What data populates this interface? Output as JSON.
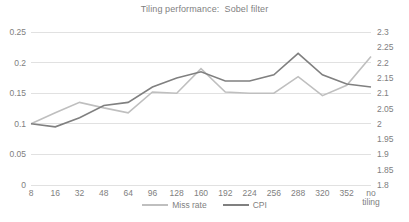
{
  "chart_data": {
    "type": "line",
    "title": "Tiling performance:  Sobel filter",
    "xlabel": "",
    "ylabel": "",
    "grid": true,
    "legend_position": "bottom",
    "categories": [
      "8",
      "16",
      "32",
      "48",
      "64",
      "96",
      "128",
      "160",
      "192",
      "224",
      "256",
      "288",
      "320",
      "352",
      "no\ntiling"
    ],
    "axes": {
      "left": {
        "name": "Miss rate",
        "ylim": [
          0,
          0.25
        ],
        "ticks": [
          "0",
          "0.05",
          "0.1",
          "0.15",
          "0.2",
          "0.25"
        ],
        "tick_values": [
          0,
          0.05,
          0.1,
          0.15,
          0.2,
          0.25
        ]
      },
      "right": {
        "name": "CPI",
        "ylim": [
          1.8,
          2.3
        ],
        "ticks": [
          "1.8",
          "1.85",
          "1.9",
          "1.95",
          "2",
          "2.05",
          "2.1",
          "2.15",
          "2.2",
          "2.25",
          "2.3"
        ],
        "tick_values": [
          1.8,
          1.85,
          1.9,
          1.95,
          2,
          2.05,
          2.1,
          2.15,
          2.2,
          2.25,
          2.3
        ]
      }
    },
    "series": [
      {
        "name": "Miss rate",
        "axis": "left",
        "color": "#bfbfbf",
        "values": [
          0.1,
          0.118,
          0.135,
          0.126,
          0.118,
          0.152,
          0.15,
          0.19,
          0.152,
          0.15,
          0.15,
          0.177,
          0.146,
          0.163,
          0.21
        ]
      },
      {
        "name": "CPI",
        "axis": "right",
        "color": "#808080",
        "values": [
          2.0,
          1.99,
          2.02,
          2.06,
          2.07,
          2.12,
          2.15,
          2.17,
          2.14,
          2.14,
          2.16,
          2.23,
          2.16,
          2.13,
          2.12
        ]
      }
    ],
    "legend": [
      {
        "label": "Miss rate",
        "color": "#bfbfbf"
      },
      {
        "label": "CPI",
        "color": "#808080"
      }
    ]
  }
}
